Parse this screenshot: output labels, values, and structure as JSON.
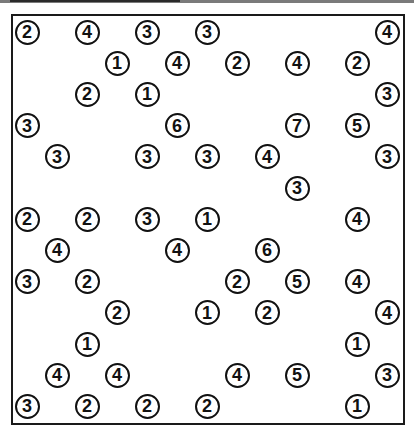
{
  "puzzle": {
    "type": "hashiwokakero",
    "columns": 13,
    "rows": 13,
    "grid_origin": {
      "x": 27,
      "y": 32
    },
    "col_pitch": 30,
    "row_pitch": 31.2,
    "colors": {
      "border": "#1a1a1a",
      "circle": "#111111",
      "background": "#ffffff"
    },
    "islands": [
      {
        "row": 0,
        "col": 0,
        "value": "2"
      },
      {
        "row": 0,
        "col": 2,
        "value": "4"
      },
      {
        "row": 0,
        "col": 4,
        "value": "3"
      },
      {
        "row": 0,
        "col": 6,
        "value": "3"
      },
      {
        "row": 0,
        "col": 12,
        "value": "4"
      },
      {
        "row": 1,
        "col": 3,
        "value": "1"
      },
      {
        "row": 1,
        "col": 5,
        "value": "4"
      },
      {
        "row": 1,
        "col": 7,
        "value": "2"
      },
      {
        "row": 1,
        "col": 9,
        "value": "4"
      },
      {
        "row": 1,
        "col": 11,
        "value": "2"
      },
      {
        "row": 2,
        "col": 2,
        "value": "2"
      },
      {
        "row": 2,
        "col": 4,
        "value": "1"
      },
      {
        "row": 2,
        "col": 12,
        "value": "3"
      },
      {
        "row": 3,
        "col": 0,
        "value": "3"
      },
      {
        "row": 3,
        "col": 5,
        "value": "6"
      },
      {
        "row": 3,
        "col": 9,
        "value": "7"
      },
      {
        "row": 3,
        "col": 11,
        "value": "5"
      },
      {
        "row": 4,
        "col": 1,
        "value": "3"
      },
      {
        "row": 4,
        "col": 4,
        "value": "3"
      },
      {
        "row": 4,
        "col": 6,
        "value": "3"
      },
      {
        "row": 4,
        "col": 8,
        "value": "4"
      },
      {
        "row": 4,
        "col": 12,
        "value": "3"
      },
      {
        "row": 5,
        "col": 9,
        "value": "3"
      },
      {
        "row": 6,
        "col": 0,
        "value": "2"
      },
      {
        "row": 6,
        "col": 2,
        "value": "2"
      },
      {
        "row": 6,
        "col": 4,
        "value": "3"
      },
      {
        "row": 6,
        "col": 6,
        "value": "1"
      },
      {
        "row": 6,
        "col": 11,
        "value": "4"
      },
      {
        "row": 7,
        "col": 1,
        "value": "4"
      },
      {
        "row": 7,
        "col": 5,
        "value": "4"
      },
      {
        "row": 7,
        "col": 8,
        "value": "6"
      },
      {
        "row": 8,
        "col": 0,
        "value": "3"
      },
      {
        "row": 8,
        "col": 2,
        "value": "2"
      },
      {
        "row": 8,
        "col": 7,
        "value": "2"
      },
      {
        "row": 8,
        "col": 9,
        "value": "5"
      },
      {
        "row": 8,
        "col": 11,
        "value": "4"
      },
      {
        "row": 9,
        "col": 3,
        "value": "2"
      },
      {
        "row": 9,
        "col": 6,
        "value": "1"
      },
      {
        "row": 9,
        "col": 8,
        "value": "2"
      },
      {
        "row": 9,
        "col": 12,
        "value": "4"
      },
      {
        "row": 10,
        "col": 2,
        "value": "1"
      },
      {
        "row": 10,
        "col": 11,
        "value": "1"
      },
      {
        "row": 11,
        "col": 1,
        "value": "4"
      },
      {
        "row": 11,
        "col": 3,
        "value": "4"
      },
      {
        "row": 11,
        "col": 7,
        "value": "4"
      },
      {
        "row": 11,
        "col": 9,
        "value": "5"
      },
      {
        "row": 11,
        "col": 12,
        "value": "3"
      },
      {
        "row": 12,
        "col": 0,
        "value": "3"
      },
      {
        "row": 12,
        "col": 2,
        "value": "2"
      },
      {
        "row": 12,
        "col": 4,
        "value": "2"
      },
      {
        "row": 12,
        "col": 6,
        "value": "2"
      },
      {
        "row": 12,
        "col": 11,
        "value": "1"
      }
    ]
  }
}
